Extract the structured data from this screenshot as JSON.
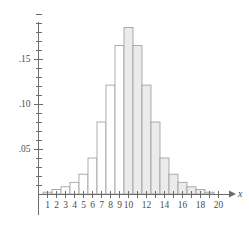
{
  "chart_data": {
    "type": "bar",
    "title": "",
    "subtitle": "",
    "xlabel": "x",
    "ylabel": "",
    "grid": false,
    "legend": null,
    "xlim": [
      0,
      21
    ],
    "ylim": [
      0,
      0.2025
    ],
    "categories": [
      1,
      2,
      3,
      4,
      5,
      6,
      7,
      8,
      9,
      10,
      11,
      12,
      13,
      14,
      15,
      16,
      17,
      18,
      19
    ],
    "values": [
      0.002,
      0.005,
      0.008,
      0.013,
      0.022,
      0.04,
      0.08,
      0.121,
      0.165,
      0.185,
      0.165,
      0.121,
      0.08,
      0.04,
      0.022,
      0.013,
      0.008,
      0.005,
      0.002
    ],
    "bar_fill": [
      "white",
      "white",
      "white",
      "white",
      "white",
      "white",
      "white",
      "white",
      "white",
      "gray",
      "gray",
      "gray",
      "gray",
      "gray",
      "gray",
      "gray",
      "gray",
      "gray",
      "gray"
    ],
    "x_tick_values": [
      1,
      2,
      3,
      4,
      5,
      6,
      7,
      8,
      9,
      10,
      11,
      12,
      13,
      14,
      15,
      16,
      17,
      18,
      19,
      20
    ],
    "x_tick_labels": [
      "1",
      "2",
      "3",
      "4",
      "5",
      "6",
      "7",
      "8",
      "9",
      "10",
      "",
      "12",
      "",
      "14",
      "",
      "16",
      "",
      "18",
      "",
      "20"
    ],
    "y_tick_values": [
      0.0,
      0.01,
      0.02,
      0.03,
      0.04,
      0.05,
      0.06,
      0.07,
      0.08,
      0.09,
      0.1,
      0.11,
      0.12,
      0.13,
      0.14,
      0.15,
      0.16,
      0.17,
      0.18,
      0.19,
      0.2
    ],
    "y_major_ticks": [
      0.05,
      0.1,
      0.15
    ],
    "y_major_labels": [
      ".05",
      ".10",
      ".15"
    ],
    "colors": {
      "axis": "#6b6b6b",
      "bar_outline": "#9a9a9a",
      "bar_shaded_fill": "#ebebeb",
      "bar_unshaded_fill": "#ffffff",
      "text": "#4d4d4d",
      "background": "#ffffff"
    }
  }
}
